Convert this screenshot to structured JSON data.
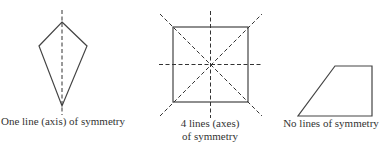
{
  "figures": [
    {
      "shape": "kite",
      "caption": [
        "One line (axis) of symmetry"
      ],
      "lines_of_symmetry": 1
    },
    {
      "shape": "square",
      "caption": [
        "4 lines (axes)",
        "of symmetry"
      ],
      "lines_of_symmetry": 4
    },
    {
      "shape": "right trapezoid",
      "caption": [
        "No lines of symmetry"
      ],
      "lines_of_symmetry": 0
    }
  ],
  "colors": {
    "stroke": "#444444",
    "text": "#333333",
    "background": "#ffffff"
  }
}
